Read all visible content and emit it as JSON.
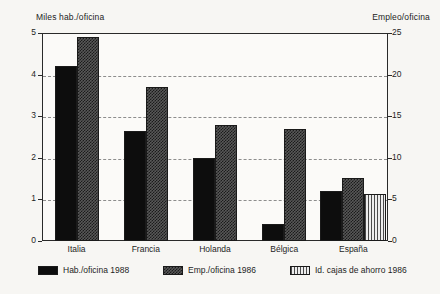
{
  "chart_data": {
    "type": "bar",
    "title": "",
    "subtitle": "",
    "categories": [
      "Italia",
      "Francia",
      "Holanda",
      "Bélgica",
      "España"
    ],
    "series": [
      {
        "name": "Hab./oficina 1988",
        "axis": "left",
        "pattern": "solid",
        "values": [
          4.2,
          2.65,
          2.0,
          0.4,
          1.2
        ]
      },
      {
        "name": "Emp./oficina 1986",
        "axis": "right",
        "pattern": "checker",
        "values": [
          24.5,
          18.5,
          14.0,
          13.5,
          7.6
        ]
      },
      {
        "name": "Id. cajas de ahorro 1986",
        "axis": "right",
        "pattern": "stripe",
        "values": [
          null,
          null,
          null,
          null,
          5.6
        ]
      }
    ],
    "left_axis": {
      "label": "Miles hab./oficina",
      "ticks": [
        "0",
        "1",
        "2",
        "3",
        "4",
        "5"
      ],
      "values": [
        0,
        1,
        2,
        3,
        4,
        5
      ],
      "ylim": [
        0,
        5
      ]
    },
    "right_axis": {
      "label": "Empleo/oficina",
      "ticks": [
        "0",
        "5",
        "10",
        "15",
        "20",
        "25"
      ],
      "values": [
        0,
        5,
        10,
        15,
        20,
        25
      ],
      "ylim": [
        0,
        25
      ]
    },
    "xlabel": "",
    "grid": true,
    "grid_style": "dashed-horizontal",
    "legend_position": "bottom",
    "legend": [
      {
        "label": "Hab./oficina 1988",
        "pattern": "solid"
      },
      {
        "label": "Emp./oficina 1986",
        "pattern": "checker"
      },
      {
        "label": "Id. cajas de ahorro 1986",
        "pattern": "stripe"
      }
    ],
    "colors": {
      "series_solid": "#0d0d0d",
      "series_checker": "#585858",
      "series_stripe": "#e9e9e9",
      "frame": "#2a2a2a",
      "grid": "#8d8d8d",
      "background": "#f7f6f3",
      "plot_background": "#fbfaf8",
      "text": "#1e1e1e"
    }
  }
}
